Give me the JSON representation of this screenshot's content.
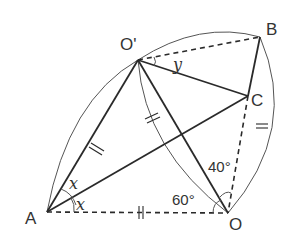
{
  "diagram": {
    "points": {
      "A": {
        "label": "A",
        "x": 47,
        "y": 212
      },
      "O": {
        "label": "O",
        "x": 228,
        "y": 213
      },
      "O_prime": {
        "label": "O'",
        "x": 138,
        "y": 60
      },
      "B": {
        "label": "B",
        "x": 260,
        "y": 37
      },
      "C": {
        "label": "C",
        "x": 248,
        "y": 96
      }
    },
    "angles": {
      "x_upper": "x",
      "x_lower": "x",
      "y": "y",
      "angle_O_60": "60°",
      "angle_O_40": "40°"
    },
    "segments": {
      "solid": [
        "A-O'",
        "A-C",
        "O'-C",
        "O'-O",
        "B-C"
      ],
      "dashed": [
        "A-O",
        "O'-B",
        "C-O"
      ],
      "equal_marks": [
        "A-O'",
        "O'-O (arc)",
        "A-O",
        "O-B (arc)"
      ]
    },
    "colors": {
      "stroke": "#2a2a2a",
      "arc": "#555555",
      "text": "#333333",
      "background": "#ffffff"
    }
  }
}
